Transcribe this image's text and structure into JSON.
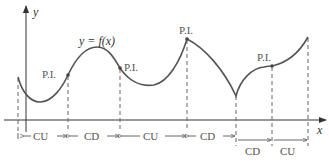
{
  "figure": {
    "function_label": "y = f(x)",
    "x_axis_label": "x",
    "y_axis_label": "y",
    "inflection_label": "P.I.",
    "colors": {
      "curve": "#555555",
      "axis": "#333333",
      "dash": "#666666",
      "text": "#555555"
    }
  },
  "inflection_points": [
    {
      "label": "P.I.",
      "x": 68,
      "y": 75
    },
    {
      "label": "P.I.",
      "x": 120,
      "y": 68
    },
    {
      "label": "P.I.",
      "x": 187,
      "y": 39
    },
    {
      "label": "P.I.",
      "x": 272,
      "y": 66
    }
  ],
  "intervals": [
    {
      "label": "CU",
      "from": 18,
      "to": 68,
      "row": 1
    },
    {
      "label": "CD",
      "from": 68,
      "to": 120,
      "row": 1
    },
    {
      "label": "CU",
      "from": 120,
      "to": 187,
      "row": 1
    },
    {
      "label": "CD",
      "from": 187,
      "to": 236,
      "row": 1
    },
    {
      "label": "CD",
      "from": 236,
      "to": 272,
      "row": 2
    },
    {
      "label": "CU",
      "from": 272,
      "to": 308,
      "row": 2
    }
  ]
}
